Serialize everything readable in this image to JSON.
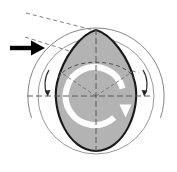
{
  "diagram": {
    "title": "Egg-shaped body rotation diagram",
    "canvas": {
      "width": 177,
      "height": 172,
      "background": "#ffffff"
    },
    "colors": {
      "body_fill": "#b3b3b3",
      "body_outline": "#1a1a1a",
      "construction_line": "#808080",
      "dashed_line": "#666666",
      "rotation_arrow": "#ffffff",
      "incident_arrow": "#000000",
      "outer_circle": "#777777"
    },
    "geometry": {
      "center": {
        "x": 96,
        "y": 96
      },
      "outer_circle_radius": 68,
      "outer_circle_gap_bottom_deg": [
        68,
        112
      ],
      "inner_circle_radius": 58,
      "egg_apex": {
        "x": 96,
        "y": 30
      },
      "egg_bottom": {
        "x": 96,
        "y": 152
      },
      "egg_half_width": 42,
      "rotation_ring_radius": 29,
      "rotation_ring_gap_deg": [
        -8,
        40
      ]
    },
    "elements": {
      "body": {
        "name": "egg-shaped-body",
        "label": "egg body"
      },
      "incident_arrow": {
        "name": "incident-direction-arrow",
        "label": "incident direction",
        "from": {
          "x": 10,
          "y": 48
        },
        "to": {
          "x": 44,
          "y": 48
        }
      },
      "rotation_arrow": {
        "name": "rotation-direction-arrow",
        "label": "spin direction",
        "sense": "clockwise"
      },
      "left_tick_arrow": {
        "name": "left-angle-arrow",
        "label": "left angular marker"
      },
      "right_tick_arrow": {
        "name": "right-angle-arrow",
        "label": "right angular marker"
      },
      "horizontal_axis": {
        "name": "horizontal-axis-dashed",
        "label": "equatorial axis",
        "x1": 27,
        "y1": 96,
        "x2": 153,
        "y2": 96
      },
      "vertical_axis": {
        "name": "vertical-axis-dashed",
        "label": "polar axis",
        "x1": 96,
        "y1": 30,
        "x2": 96,
        "y2": 152
      },
      "upper_tangent_line": {
        "name": "upper-tangent-dashed-line",
        "label": "upper construction line",
        "x1": 26,
        "y1": 14,
        "x2": 96,
        "y2": 31
      },
      "lower_tangent_line": {
        "name": "lower-tangent-dashed-line",
        "label": "lower construction line",
        "x1": 26,
        "y1": 38,
        "x2": 138,
        "y2": 72
      },
      "latitude_arc": {
        "name": "latitude-dashed-arc",
        "label": "terminator arc"
      },
      "cone_line_left": {
        "name": "cone-dashed-line-left",
        "label": "left radial line"
      },
      "cone_line_right": {
        "name": "cone-dashed-line-right",
        "label": "right radial line"
      }
    }
  }
}
